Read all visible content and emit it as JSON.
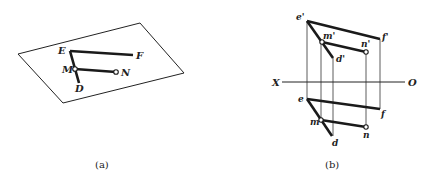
{
  "panel_a": {
    "caption": "(a)",
    "plane": {
      "points": [
        [
          18,
          54
        ],
        [
          140,
          23
        ],
        [
          184,
          73
        ],
        [
          63,
          103
        ]
      ]
    },
    "segments": {
      "EF": {
        "from": [
          70,
          51
        ],
        "to": [
          133,
          55
        ]
      },
      "ED": {
        "from": [
          70,
          51
        ],
        "to": [
          79,
          83
        ]
      },
      "MN": {
        "from": [
          75,
          69
        ],
        "to": [
          116,
          72
        ]
      }
    },
    "points": {
      "E": {
        "label": "E",
        "x": 70,
        "y": 51
      },
      "F": {
        "label": "F",
        "x": 133,
        "y": 55
      },
      "M": {
        "label": "M",
        "x": 75,
        "y": 69
      },
      "N": {
        "label": "N",
        "x": 116,
        "y": 72
      },
      "D": {
        "label": "D",
        "x": 79,
        "y": 83
      }
    }
  },
  "panel_b": {
    "caption": "(b)",
    "axis": {
      "label_left": "X",
      "label_right": "O",
      "y": 82,
      "x1": 282,
      "x2": 405
    },
    "front_view": {
      "e": {
        "label": "e'",
        "x": 307,
        "y": 21
      },
      "f": {
        "label": "f'",
        "x": 380,
        "y": 39
      },
      "m": {
        "label": "m'",
        "x": 322,
        "y": 42
      },
      "n": {
        "label": "n'",
        "x": 366,
        "y": 52
      },
      "d": {
        "label": "d'",
        "x": 333,
        "y": 58
      }
    },
    "top_view": {
      "e": {
        "label": "e",
        "x": 307,
        "y": 99
      },
      "f": {
        "label": "f",
        "x": 380,
        "y": 109
      },
      "m": {
        "label": "m",
        "x": 321,
        "y": 120
      },
      "n": {
        "label": "n",
        "x": 366,
        "y": 127
      },
      "d": {
        "label": "d",
        "x": 332,
        "y": 136
      }
    }
  },
  "colors": {
    "line": "#1a1a1a",
    "thin": "#333333",
    "background": "#ffffff"
  }
}
